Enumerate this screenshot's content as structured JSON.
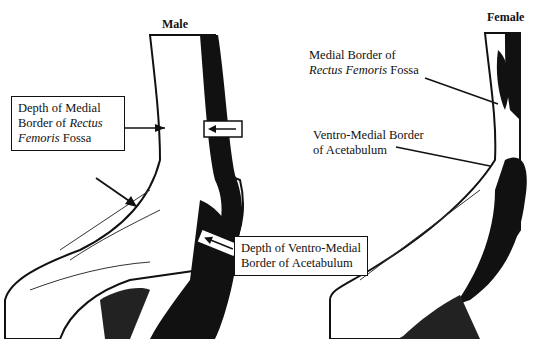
{
  "panels": [
    {
      "title": "Male"
    },
    {
      "title": "Female"
    }
  ],
  "male_labels": {
    "rectus_1": "Depth of Medial",
    "rectus_2a": "Border of ",
    "rectus_2b": "Rectus",
    "rectus_3a": "Femoris",
    "rectus_3b": " Fossa",
    "acet_1": "Depth of Ventro-Medial",
    "acet_2": "Border of Acetabulum"
  },
  "female_labels": {
    "rectus_1": "Medial Border of",
    "rectus_2a": "Rectus Femoris",
    "rectus_2b": " Fossa",
    "acet_1": "Ventro-Medial Border",
    "acet_2": "of Acetabulum"
  }
}
